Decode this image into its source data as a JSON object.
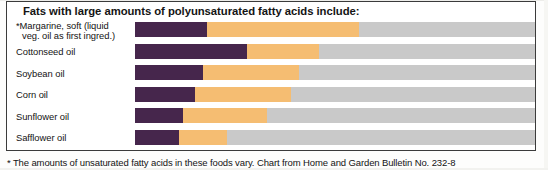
{
  "chart_data": {
    "type": "bar",
    "title": "Fats with large amounts of polyunsaturated fatty acids include:",
    "subtype": "stacked-horizontal",
    "xlabel": "",
    "ylabel": "",
    "xlim": [
      0,
      100
    ],
    "grid": false,
    "legend_position": "none",
    "axis_unit": "percent of total fatty acids",
    "categories": [
      "*Margarine, soft (liquid veg. oil as first ingred.)",
      "Cottonseed oil",
      "Soybean oil",
      "Corn oil",
      "Sunflower oil",
      "Safflower oil"
    ],
    "series": [
      {
        "name": "Saturated fat",
        "color": "#46264c",
        "values": [
          18,
          28,
          17,
          15,
          12,
          11
        ]
      },
      {
        "name": "Monounsaturated fat",
        "color": "#f5bd72",
        "values": [
          38,
          18,
          24,
          24,
          21,
          12
        ]
      },
      {
        "name": "Polyunsaturated fat",
        "color": "#c9c9c9",
        "values": [
          44,
          54,
          59,
          61,
          67,
          77
        ]
      }
    ],
    "annotations": [
      "* The amounts of unsaturated fatty acids in these foods vary. Chart from Home and Garden Bulletin No. 232-8"
    ]
  },
  "panel": {
    "title": "Fats with large amounts of polyunsaturated fatty acids include:",
    "rows": [
      {
        "label_line1": "*Margarine, soft (liquid",
        "label_line2": "veg. oil as first ingred.)",
        "sat_pct": 18,
        "mono_end_pct": 56
      },
      {
        "label_line1": "Cottonseed oil",
        "label_line2": "",
        "sat_pct": 28,
        "mono_end_pct": 46
      },
      {
        "label_line1": "Soybean oil",
        "label_line2": "",
        "sat_pct": 17,
        "mono_end_pct": 41
      },
      {
        "label_line1": "Corn oil",
        "label_line2": "",
        "sat_pct": 15,
        "mono_end_pct": 39
      },
      {
        "label_line1": "Sunflower oil",
        "label_line2": "",
        "sat_pct": 12,
        "mono_end_pct": 33
      },
      {
        "label_line1": "Safflower oil",
        "label_line2": "",
        "sat_pct": 11,
        "mono_end_pct": 23
      }
    ]
  },
  "footnote": {
    "text": "* The amounts of unsaturated fatty acids in these foods vary. Chart from Home and Garden Bulletin No. 232-8"
  },
  "colors": {
    "saturated": "#46264c",
    "monounsaturated": "#f5bd72",
    "polyunsaturated": "#c9c9c9",
    "border": "#3b3b3b",
    "text": "#141414"
  }
}
